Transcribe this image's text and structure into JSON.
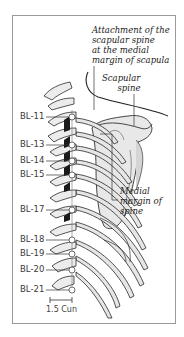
{
  "figure": {
    "annotations": {
      "attachment": [
        "Attachment of the",
        "scapular spine",
        "at the medial",
        "margin of scapula"
      ],
      "scapular_spine": [
        "Scapular",
        "spine"
      ],
      "medial_margin": [
        "Medial",
        "margin of",
        "spine"
      ]
    },
    "points": [
      {
        "label": "BL-11",
        "y": 117
      },
      {
        "label": "BL-13",
        "y": 145
      },
      {
        "label": "BL-14",
        "y": 161
      },
      {
        "label": "BL-15",
        "y": 175
      },
      {
        "label": "BL-17",
        "y": 210
      },
      {
        "label": "BL-18",
        "y": 240
      },
      {
        "label": "BL-19",
        "y": 254
      },
      {
        "label": "BL-20",
        "y": 270
      },
      {
        "label": "BL-21",
        "y": 290
      }
    ],
    "scale_label": "1.5 Cun",
    "colors": {
      "bone_fill": "#e6e6e6",
      "bone_stroke": "#2a2a2a",
      "shadow": "#1a1a1a",
      "frame": "#9a9a9a",
      "point_fill": "#ffffff"
    }
  }
}
